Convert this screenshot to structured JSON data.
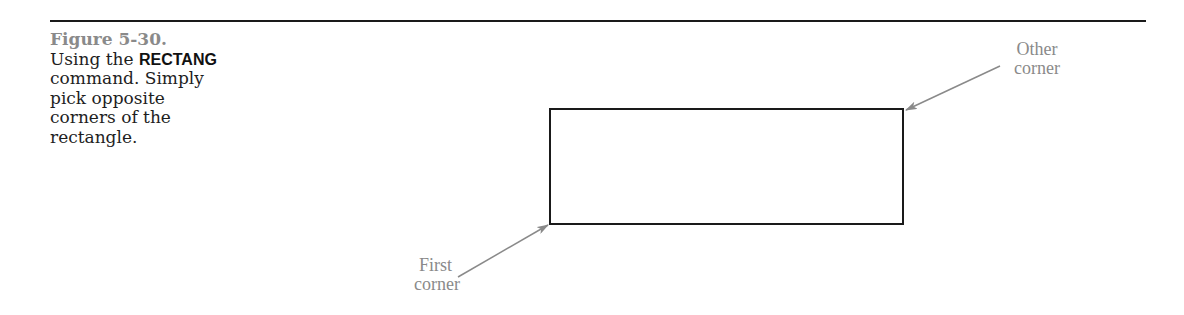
{
  "figure": {
    "number": "Figure 5-30.",
    "caption_prefix": "Using the ",
    "command": "RECTANG",
    "caption_suffix": " command. Simply pick opposite corners of the rectangle."
  },
  "drawing": {
    "rectangle": {
      "x1": 550,
      "y1": 109,
      "x2": 903,
      "y2": 224
    },
    "labels": {
      "other_corner_line1": "Other",
      "other_corner_line2": "corner",
      "first_corner_line1": "First",
      "first_corner_line2": "corner"
    },
    "colors": {
      "line": "#1a1a1a",
      "annotation": "#8a8a8a"
    }
  }
}
